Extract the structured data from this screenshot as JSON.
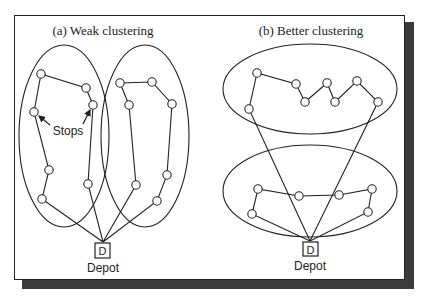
{
  "panels": [
    {
      "id": "a",
      "title": "(a) Weak clustering",
      "depot_letter": "D",
      "depot_label": "Depot",
      "annotation": "Stops"
    },
    {
      "id": "b",
      "title": "(b) Better clustering",
      "depot_letter": "D",
      "depot_label": "Depot"
    }
  ],
  "colors": {
    "stroke": "#222222",
    "background": "#ffffff",
    "shadow": "#3a3a3a"
  }
}
